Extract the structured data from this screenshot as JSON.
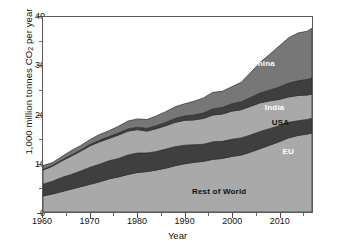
{
  "chart_data": {
    "type": "area",
    "title": "",
    "xlabel": "Year",
    "ylabel": "1,000 million tonnes CO2 per year",
    "ylabel_prefix": "1,000 million tonnes CO",
    "ylabel_sub": "2",
    "ylabel_suffix": " per year",
    "xlim": [
      1960,
      2017
    ],
    "ylim": [
      0,
      40
    ],
    "grid": false,
    "legend_position": "inline-annotations",
    "stacked": true,
    "x_ticks": [
      1960,
      1970,
      1980,
      1990,
      2000,
      2010
    ],
    "x_minor_ticks": [
      1965,
      1975,
      1985,
      1995,
      2005,
      2015
    ],
    "y_ticks": [
      0,
      10,
      20,
      30,
      40
    ],
    "y_minor_ticks": [
      5,
      15,
      25,
      35
    ],
    "x": [
      1960,
      1962,
      1964,
      1966,
      1968,
      1970,
      1972,
      1974,
      1976,
      1978,
      1980,
      1982,
      1984,
      1986,
      1988,
      1990,
      1992,
      1994,
      1996,
      1998,
      2000,
      2002,
      2004,
      2006,
      2008,
      2010,
      2012,
      2014,
      2016,
      2017
    ],
    "stack_order_bottom_to_top": [
      "Rest of World",
      "EU",
      "USA",
      "India",
      "China"
    ],
    "series": [
      {
        "name": "Rest of World",
        "color": "#a9a9a9",
        "label_x": 2003,
        "label_y": 4.5,
        "label_color": "dark",
        "values": [
          3.3,
          3.7,
          4.2,
          4.7,
          5.2,
          5.7,
          6.2,
          6.8,
          7.2,
          7.7,
          8.1,
          8.3,
          8.6,
          9.0,
          9.5,
          9.9,
          10.2,
          10.4,
          10.8,
          11.0,
          11.4,
          11.7,
          12.3,
          13.0,
          13.7,
          14.4,
          15.2,
          15.7,
          16.0,
          16.2
        ]
      },
      {
        "name": "EU",
        "color": "#3f3f3f",
        "label_x": 2013,
        "label_y": 12.5,
        "label_color": "light",
        "values": [
          2.4,
          2.6,
          2.9,
          3.0,
          3.2,
          3.5,
          3.6,
          3.7,
          3.8,
          4.0,
          4.0,
          3.8,
          3.8,
          3.9,
          3.9,
          3.8,
          3.6,
          3.5,
          3.6,
          3.5,
          3.5,
          3.5,
          3.5,
          3.5,
          3.4,
          3.3,
          3.2,
          3.0,
          3.0,
          3.0
        ]
      },
      {
        "name": "USA",
        "color": "#a9a9a9",
        "label_x": 2012,
        "label_y": 18.5,
        "label_color": "dark",
        "values": [
          2.9,
          3.1,
          3.4,
          3.8,
          4.1,
          4.4,
          4.6,
          4.6,
          4.8,
          4.9,
          4.8,
          4.5,
          4.7,
          4.8,
          5.0,
          5.1,
          5.1,
          5.3,
          5.5,
          5.6,
          5.8,
          5.8,
          5.9,
          5.9,
          5.7,
          5.4,
          5.2,
          5.2,
          5.0,
          5.0
        ]
      },
      {
        "name": "India",
        "color": "#3f3f3f",
        "label_x": 2011,
        "label_y": 21.5,
        "label_color": "light",
        "values": [
          0.12,
          0.14,
          0.17,
          0.2,
          0.24,
          0.28,
          0.32,
          0.37,
          0.4,
          0.45,
          0.5,
          0.55,
          0.6,
          0.68,
          0.78,
          0.9,
          1.0,
          1.1,
          1.25,
          1.35,
          1.5,
          1.6,
          1.8,
          2.0,
          2.2,
          2.5,
          2.8,
          3.0,
          3.2,
          3.3
        ]
      },
      {
        "name": "China",
        "color": "#777777",
        "label_x": 2009,
        "label_y": 30.5,
        "label_color": "light",
        "values": [
          0.8,
          0.6,
          0.7,
          0.9,
          0.9,
          1.0,
          1.2,
          1.2,
          1.4,
          1.6,
          1.7,
          1.8,
          2.0,
          2.2,
          2.4,
          2.5,
          2.8,
          3.1,
          3.4,
          3.3,
          3.5,
          4.0,
          5.1,
          6.3,
          7.3,
          8.4,
          9.3,
          9.8,
          9.9,
          10.2
        ]
      }
    ],
    "credit": "Source: Carbon Dioxide Information Analysis Center"
  }
}
